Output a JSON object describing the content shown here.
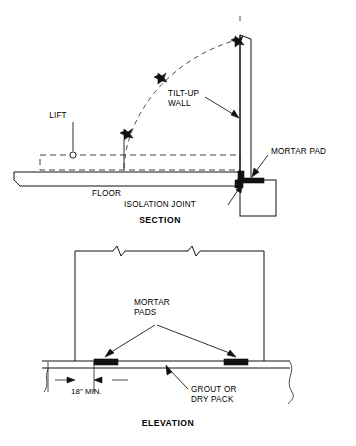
{
  "sheet": {
    "background_color": "#ffffff",
    "line_color": "#111111"
  },
  "section_view": {
    "title": "SECTION",
    "labels": {
      "lift": "LIFT",
      "tilt_up_wall_line1": "TILT-UP",
      "tilt_up_wall_line2": "WALL",
      "mortar_pad": "MORTAR PAD",
      "floor": "FLOOR",
      "isolation_joint": "ISOLATION JOINT"
    }
  },
  "elevation_view": {
    "title": "ELEVATION",
    "labels": {
      "mortar_pads_line1": "MORTAR",
      "mortar_pads_line2": "PADS",
      "grout_line1": "GROUT OR",
      "grout_line2": "DRY PACK",
      "dimension": "18\" MIN."
    }
  }
}
